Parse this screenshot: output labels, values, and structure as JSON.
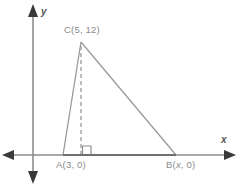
{
  "diagram": {
    "type": "coordinate-geometry-triangle",
    "background_color": "#ffffff",
    "axes": {
      "x_axis_label": "x",
      "y_axis_label": "y",
      "axis_color": "#8c8c8c",
      "x_axis_y_px": 155,
      "y_axis_x_px": 33,
      "arrowheads": "both-ends"
    },
    "vertices": {
      "a": {
        "label": "A(3, 0)",
        "x": 3,
        "y": 0,
        "px_x": 63,
        "px_y": 155
      },
      "b": {
        "label": "B(x, 0)",
        "x": "x",
        "y": 0,
        "px_x": 176,
        "px_y": 155
      },
      "c": {
        "label": "C(5, 12)",
        "x": 5,
        "y": 12,
        "px_x": 81,
        "px_y": 42
      }
    },
    "altitude": {
      "style": "dashed",
      "from": "C",
      "to_px_x": 81,
      "to_px_y": 155,
      "color": "#9a9a9a"
    },
    "right_angle_marker": {
      "present": true,
      "px_x": 82,
      "px_y": 146,
      "size_px": 9,
      "color": "#8c8c8c"
    },
    "triangle": {
      "stroke_color": "#9a9a9a",
      "base_stroke_color": "#7a7a7a",
      "fill": "none"
    }
  },
  "chart_data": {
    "type": "scatter",
    "title": "",
    "xlabel": "x",
    "ylabel": "y",
    "points": [
      {
        "name": "A",
        "label": "A(3, 0)",
        "x": 3,
        "y": 0
      },
      {
        "name": "B",
        "label": "B(x, 0)",
        "x": null,
        "y": 0
      },
      {
        "name": "C",
        "label": "C(5, 12)",
        "x": 5,
        "y": 12
      }
    ],
    "annotations": [
      "right angle at foot of altitude from C to AB"
    ],
    "grid": false,
    "legend": "none"
  }
}
